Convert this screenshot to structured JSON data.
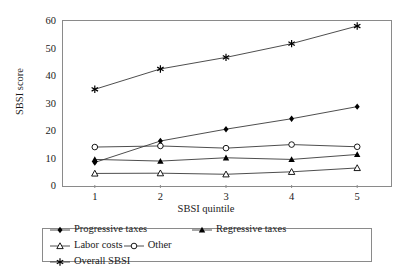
{
  "chart_data": {
    "type": "line",
    "title": "",
    "xlabel": "SBSI quintile",
    "ylabel": "SBSI score",
    "categories": [
      "1",
      "2",
      "3",
      "4",
      "5"
    ],
    "x": [
      1,
      2,
      3,
      4,
      5
    ],
    "xlim": [
      0.5,
      5.5
    ],
    "ylim": [
      0,
      60
    ],
    "yticks": [
      0,
      10,
      20,
      30,
      40,
      50,
      60
    ],
    "xticks": [
      "1",
      "2",
      "3",
      "4",
      "5"
    ],
    "grid": false,
    "legend_position": "bottom",
    "series": [
      {
        "name": "Progressive taxes",
        "marker": "filled-diamond",
        "color": "#000000",
        "values": [
          8.2,
          16.0,
          20.3,
          24.1,
          28.5
        ]
      },
      {
        "name": "Regressive taxes",
        "marker": "filled-triangle",
        "color": "#000000",
        "values": [
          9.3,
          8.7,
          9.9,
          9.3,
          11.1
        ]
      },
      {
        "name": "Labor costs",
        "marker": "open-triangle",
        "color": "#000000",
        "values": [
          4.2,
          4.3,
          3.9,
          4.8,
          6.2
        ]
      },
      {
        "name": "Other",
        "marker": "open-circle",
        "color": "#000000",
        "values": [
          13.8,
          14.2,
          13.4,
          14.7,
          13.9
        ]
      },
      {
        "name": "Overall SBSI",
        "marker": "asterisk",
        "color": "#000000",
        "values": [
          34.8,
          42.2,
          46.4,
          51.4,
          57.8
        ]
      }
    ]
  },
  "axes": {
    "y_title": "SBSI score",
    "x_title": "SBSI quintile",
    "y_ticks": [
      "60",
      "50",
      "40",
      "30",
      "20",
      "10",
      "0"
    ],
    "x_ticks": [
      "1",
      "2",
      "3",
      "4",
      "5"
    ]
  },
  "legend": {
    "items": [
      {
        "label": "Progressive taxes",
        "marker": "filled-diamond"
      },
      {
        "label": "Regressive taxes",
        "marker": "filled-triangle"
      },
      {
        "label": "Labor costs",
        "marker": "open-triangle"
      },
      {
        "label": "Other",
        "marker": "open-circle"
      },
      {
        "label": "Overall SBSI",
        "marker": "asterisk"
      }
    ]
  },
  "colors": {
    "line": "#3a3a3a",
    "frame": "#8a8a8a",
    "text": "#1a1a1a"
  }
}
